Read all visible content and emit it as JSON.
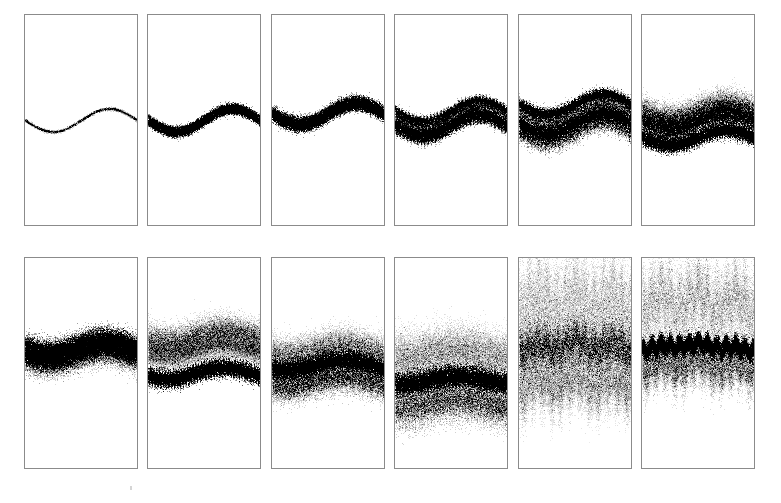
{
  "figure": {
    "title": "",
    "caption": "",
    "background_color": "#ffffff",
    "panel_border_color": "#8b8b8b",
    "ink_color": "#2b2b2b",
    "width": 781,
    "height": 503,
    "rows": 2,
    "columns": 6,
    "panel_count": 12
  },
  "layout": {
    "panel_width": 114,
    "panel_height": 212,
    "column_gap": 9,
    "row_gap": 31,
    "origin_x": 24,
    "origin_y": 14,
    "row_y": [
      14,
      257
    ],
    "column_x": [
      24,
      147,
      271,
      394,
      518,
      641
    ]
  },
  "chart_data": {
    "type": "scatter",
    "title": "",
    "subtitle": "",
    "xlabel": "",
    "ylabel": "",
    "xlim": [
      0,
      1
    ],
    "ylim": [
      0,
      1
    ],
    "grid": false,
    "legend_position": "none",
    "tick_labels_x": [],
    "tick_labels_y": [],
    "annotations": [],
    "series": [
      {
        "name": "panel-1",
        "index": 1,
        "row": 0,
        "column": 0,
        "stage_label": "t1",
        "ensemble_members": 1,
        "band_count": 1,
        "mean_level": 0.5,
        "wave_amplitude": 0.055,
        "wave_cycles": 1.0,
        "wave_phase": 0.0,
        "spread": 0.004,
        "ripple_amplitude": 0.0,
        "ripple_cycles": 0,
        "density": 0.1,
        "ink_darkness": 0.3,
        "points": 2600,
        "bands": [
          {
            "offset": 0.0,
            "spread": 0.004,
            "weight": 1.0,
            "darkness": 0.3,
            "ripple": 0.0
          }
        ]
      },
      {
        "name": "panel-2",
        "index": 2,
        "row": 0,
        "column": 1,
        "stage_label": "t2",
        "ensemble_members": 40,
        "band_count": 2,
        "mean_level": 0.5,
        "wave_amplitude": 0.055,
        "wave_cycles": 1.0,
        "wave_phase": 0.0,
        "spread": 0.016,
        "ripple_amplitude": 0.004,
        "ripple_cycles": 20,
        "density": 0.55,
        "ink_darkness": 0.85,
        "points": 9000,
        "bands": [
          {
            "offset": -0.012,
            "spread": 0.009,
            "weight": 1.0,
            "darkness": 0.9,
            "ripple": 0.004
          },
          {
            "offset": 0.012,
            "spread": 0.009,
            "weight": 1.0,
            "darkness": 0.9,
            "ripple": 0.004
          }
        ]
      },
      {
        "name": "panel-3",
        "index": 3,
        "row": 0,
        "column": 2,
        "stage_label": "t3",
        "ensemble_members": 80,
        "band_count": 2,
        "mean_level": 0.47,
        "wave_amplitude": 0.05,
        "wave_cycles": 1.0,
        "wave_phase": 0.0,
        "spread": 0.028,
        "ripple_amplitude": 0.006,
        "ripple_cycles": 22,
        "density": 0.7,
        "ink_darkness": 0.8,
        "points": 13000,
        "bands": [
          {
            "offset": -0.016,
            "spread": 0.014,
            "weight": 1.0,
            "darkness": 0.78,
            "ripple": 0.005
          },
          {
            "offset": 0.014,
            "spread": 0.013,
            "weight": 1.0,
            "darkness": 0.85,
            "ripple": 0.005
          }
        ]
      },
      {
        "name": "panel-4",
        "index": 4,
        "row": 0,
        "column": 3,
        "stage_label": "t4",
        "ensemble_members": 140,
        "band_count": 4,
        "mean_level": 0.5,
        "wave_amplitude": 0.05,
        "wave_cycles": 1.0,
        "wave_phase": 0.0,
        "spread": 0.07,
        "ripple_amplitude": 0.012,
        "ripple_cycles": 16,
        "density": 0.8,
        "ink_darkness": 0.8,
        "points": 20000,
        "bands": [
          {
            "offset": -0.058,
            "spread": 0.01,
            "weight": 0.8,
            "darkness": 0.6,
            "ripple": 0.014
          },
          {
            "offset": -0.02,
            "spread": 0.016,
            "weight": 1.0,
            "darkness": 0.5,
            "ripple": 0.008
          },
          {
            "offset": 0.012,
            "spread": 0.012,
            "weight": 1.0,
            "darkness": 0.95,
            "ripple": 0.006
          },
          {
            "offset": 0.05,
            "spread": 0.013,
            "weight": 0.9,
            "darkness": 0.7,
            "ripple": 0.015
          }
        ]
      },
      {
        "name": "panel-5",
        "index": 5,
        "row": 0,
        "column": 4,
        "stage_label": "t5",
        "ensemble_members": 200,
        "band_count": 4,
        "mean_level": 0.5,
        "wave_amplitude": 0.048,
        "wave_cycles": 1.0,
        "wave_phase": 0.0,
        "spread": 0.105,
        "ripple_amplitude": 0.012,
        "ripple_cycles": 16,
        "density": 0.85,
        "ink_darkness": 0.75,
        "points": 26000,
        "bands": [
          {
            "offset": -0.085,
            "spread": 0.013,
            "weight": 0.9,
            "darkness": 0.8,
            "ripple": 0.01
          },
          {
            "offset": -0.03,
            "spread": 0.026,
            "weight": 1.0,
            "darkness": 0.45,
            "ripple": 0.01
          },
          {
            "offset": 0.008,
            "spread": 0.016,
            "weight": 1.0,
            "darkness": 0.85,
            "ripple": 0.008
          },
          {
            "offset": 0.062,
            "spread": 0.024,
            "weight": 0.9,
            "darkness": 0.55,
            "ripple": 0.014
          }
        ]
      },
      {
        "name": "panel-6",
        "index": 6,
        "row": 0,
        "column": 5,
        "stage_label": "t6",
        "ensemble_members": 260,
        "band_count": 3,
        "mean_level": 0.52,
        "wave_amplitude": 0.035,
        "wave_cycles": 1.0,
        "wave_phase": 0.0,
        "spread": 0.12,
        "ripple_amplitude": 0.016,
        "ripple_cycles": 22,
        "density": 0.9,
        "ink_darkness": 0.7,
        "points": 30000,
        "bands": [
          {
            "offset": -0.07,
            "spread": 0.034,
            "weight": 1.0,
            "darkness": 0.35,
            "ripple": 0.01
          },
          {
            "offset": -0.005,
            "spread": 0.028,
            "weight": 1.0,
            "darkness": 0.6,
            "ripple": 0.012
          },
          {
            "offset": 0.052,
            "spread": 0.017,
            "weight": 1.0,
            "darkness": 0.9,
            "ripple": 0.018
          }
        ]
      },
      {
        "name": "panel-7",
        "index": 7,
        "row": 1,
        "column": 0,
        "stage_label": "t7",
        "ensemble_members": 300,
        "band_count": 2,
        "mean_level": 0.44,
        "wave_amplitude": 0.03,
        "wave_cycles": 1.0,
        "wave_phase": 0.3,
        "spread": 0.1,
        "ripple_amplitude": 0.012,
        "ripple_cycles": 24,
        "density": 0.9,
        "ink_darkness": 0.75,
        "points": 30000,
        "bands": [
          {
            "offset": -0.024,
            "spread": 0.03,
            "weight": 1.0,
            "darkness": 0.75,
            "ripple": 0.008
          },
          {
            "offset": 0.03,
            "spread": 0.034,
            "weight": 1.0,
            "darkness": 0.45,
            "ripple": 0.012
          }
        ]
      },
      {
        "name": "panel-8",
        "index": 8,
        "row": 1,
        "column": 1,
        "stage_label": "t8",
        "ensemble_members": 320,
        "band_count": 3,
        "mean_level": 0.46,
        "wave_amplitude": 0.028,
        "wave_cycles": 1.0,
        "wave_phase": 0.5,
        "spread": 0.175,
        "ripple_amplitude": 0.016,
        "ripple_cycles": 20,
        "density": 0.88,
        "ink_darkness": 0.7,
        "points": 32000,
        "bands": [
          {
            "offset": -0.09,
            "spread": 0.04,
            "weight": 1.0,
            "darkness": 0.32,
            "ripple": 0.008
          },
          {
            "offset": -0.01,
            "spread": 0.03,
            "weight": 0.8,
            "darkness": 0.25,
            "ripple": 0.01
          },
          {
            "offset": 0.075,
            "spread": 0.02,
            "weight": 1.0,
            "darkness": 0.95,
            "ripple": 0.02
          }
        ]
      },
      {
        "name": "panel-9",
        "index": 9,
        "row": 1,
        "column": 2,
        "stage_label": "t9",
        "ensemble_members": 340,
        "band_count": 3,
        "mean_level": 0.52,
        "wave_amplitude": 0.024,
        "wave_cycles": 1.0,
        "wave_phase": 0.8,
        "spread": 0.17,
        "ripple_amplitude": 0.016,
        "ripple_cycles": 22,
        "density": 0.88,
        "ink_darkness": 0.72,
        "points": 32000,
        "bands": [
          {
            "offset": -0.085,
            "spread": 0.042,
            "weight": 1.0,
            "darkness": 0.3,
            "ripple": 0.008
          },
          {
            "offset": 0.0,
            "spread": 0.022,
            "weight": 1.0,
            "darkness": 0.92,
            "ripple": 0.018
          },
          {
            "offset": 0.06,
            "spread": 0.036,
            "weight": 1.0,
            "darkness": 0.4,
            "ripple": 0.012
          }
        ]
      },
      {
        "name": "panel-10",
        "index": 10,
        "row": 1,
        "column": 3,
        "stage_label": "t10",
        "ensemble_members": 380,
        "band_count": 3,
        "mean_level": 0.6,
        "wave_amplitude": 0.018,
        "wave_cycles": 1.0,
        "wave_phase": 1.2,
        "spread": 0.26,
        "ripple_amplitude": 0.018,
        "ripple_cycles": 18,
        "density": 0.9,
        "ink_darkness": 0.7,
        "points": 36000,
        "bands": [
          {
            "offset": -0.15,
            "spread": 0.06,
            "weight": 1.0,
            "darkness": 0.26,
            "ripple": 0.01
          },
          {
            "offset": -0.01,
            "spread": 0.026,
            "weight": 1.0,
            "darkness": 0.9,
            "ripple": 0.016
          },
          {
            "offset": 0.075,
            "spread": 0.05,
            "weight": 1.0,
            "darkness": 0.4,
            "ripple": 0.02
          }
        ]
      },
      {
        "name": "panel-11",
        "index": 11,
        "row": 1,
        "column": 4,
        "stage_label": "t11",
        "ensemble_members": 420,
        "band_count": 3,
        "mean_level": 0.4,
        "wave_amplitude": 0.012,
        "wave_cycles": 1.0,
        "wave_phase": 1.6,
        "spread": 0.4,
        "ripple_amplitude": 0.03,
        "ripple_cycles": 6,
        "density": 0.92,
        "ink_darkness": 0.55,
        "points": 42000,
        "caustics": true,
        "caustic_count": 6,
        "bands": [
          {
            "offset": -0.23,
            "spread": 0.11,
            "weight": 1.0,
            "darkness": 0.22,
            "ripple": 0.032
          },
          {
            "offset": 0.02,
            "spread": 0.06,
            "weight": 1.0,
            "darkness": 0.45,
            "ripple": 0.02
          },
          {
            "offset": 0.17,
            "spread": 0.07,
            "weight": 1.0,
            "darkness": 0.25,
            "ripple": 0.024
          }
        ]
      },
      {
        "name": "panel-12",
        "index": 12,
        "row": 1,
        "column": 5,
        "stage_label": "t12",
        "ensemble_members": 450,
        "band_count": 3,
        "mean_level": 0.38,
        "wave_amplitude": 0.01,
        "wave_cycles": 1.0,
        "wave_phase": 2.0,
        "spread": 0.36,
        "ripple_amplitude": 0.03,
        "ripple_cycles": 6,
        "density": 0.92,
        "ink_darkness": 0.6,
        "points": 42000,
        "caustics": true,
        "caustic_count": 6,
        "bands": [
          {
            "offset": -0.21,
            "spread": 0.1,
            "weight": 1.0,
            "darkness": 0.24,
            "ripple": 0.034
          },
          {
            "offset": 0.04,
            "spread": 0.022,
            "weight": 1.0,
            "darkness": 0.95,
            "ripple": 0.016
          },
          {
            "offset": 0.105,
            "spread": 0.055,
            "weight": 1.0,
            "darkness": 0.32,
            "ripple": 0.022
          }
        ]
      }
    ]
  },
  "artifacts": [
    {
      "name": "page-speck",
      "x": 130,
      "y": 486,
      "width": 2,
      "height": 4,
      "color": "#d5d5d5"
    }
  ]
}
